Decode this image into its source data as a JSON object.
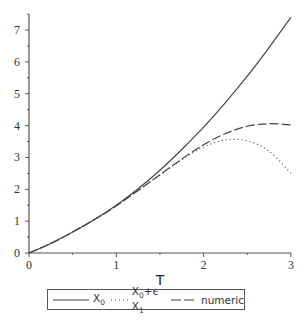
{
  "chart_data": {
    "type": "line",
    "title": "",
    "xlabel": "T",
    "ylabel": "",
    "xlim": [
      0,
      3
    ],
    "ylim": [
      0,
      7.5
    ],
    "x_ticks": [
      "0",
      "1",
      "2",
      "3"
    ],
    "y_ticks": [
      "0",
      "1",
      "2",
      "3",
      "4",
      "5",
      "6",
      "7"
    ],
    "grid": false,
    "legend_position": "bottom",
    "x": [
      0,
      0.25,
      0.5,
      0.75,
      1.0,
      1.25,
      1.5,
      1.75,
      2.0,
      2.25,
      2.5,
      2.75,
      3.0
    ],
    "series": [
      {
        "name": "X_0",
        "style": "solid",
        "values": [
          0,
          0.3,
          0.66,
          1.05,
          1.5,
          2.02,
          2.6,
          3.25,
          3.95,
          4.72,
          5.55,
          6.45,
          7.4
        ]
      },
      {
        "name": "X_0+ε X_1",
        "style": "dotted",
        "values": [
          0,
          0.3,
          0.66,
          1.05,
          1.48,
          1.96,
          2.45,
          2.93,
          3.33,
          3.55,
          3.52,
          3.2,
          2.5
        ]
      },
      {
        "name": "numeric",
        "style": "dashed",
        "values": [
          0,
          0.3,
          0.66,
          1.05,
          1.48,
          1.96,
          2.46,
          2.95,
          3.4,
          3.75,
          3.98,
          4.06,
          4.02
        ]
      }
    ]
  },
  "legend": {
    "items": [
      {
        "main": "X",
        "sub": "0",
        "rest": "",
        "rest_sub": ""
      },
      {
        "main": "X",
        "sub": "0",
        "rest": "+ϵ X",
        "rest_sub": "1"
      },
      {
        "main": "numeric",
        "sub": "",
        "rest": "",
        "rest_sub": ""
      }
    ]
  },
  "axes": {
    "xlabel": "T"
  }
}
